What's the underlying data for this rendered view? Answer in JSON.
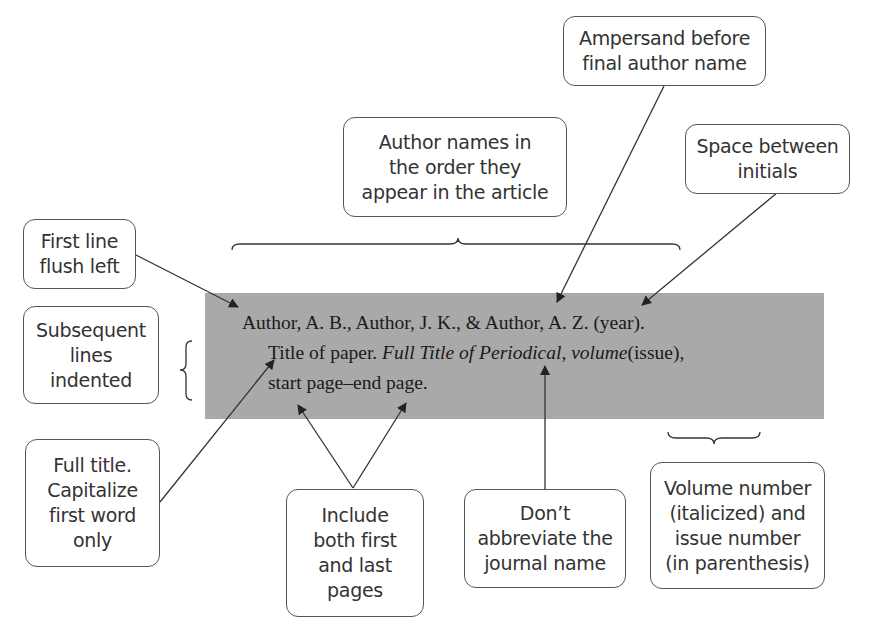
{
  "reference": {
    "line1": "Author, A. B., Author, J. K., & Author, A. Z. (year).",
    "line2_plain": "Title of paper. ",
    "line2_italic": "Full Title of Periodical, volume",
    "line2_end": "(issue),",
    "line3": "start page–end page."
  },
  "callouts": {
    "ampersand": "Ampersand before\nfinal author name",
    "author_order": "Author names in\nthe order they\nappear in the article",
    "space_initials": "Space between\ninitials",
    "first_line": "First line\nflush left",
    "subsequent": "Subsequent\nlines\nindented",
    "full_title": "Full title.\nCapitalize\nfirst word\nonly",
    "pages": "Include\nboth first\nand last\npages",
    "journal": "Don’t\nabbreviate the\njournal name",
    "volume": "Volume number\n(italicized) and\nissue number\n(in parenthesis)"
  },
  "colors": {
    "reference_background": "#a9a9a9",
    "line": "#333333"
  }
}
